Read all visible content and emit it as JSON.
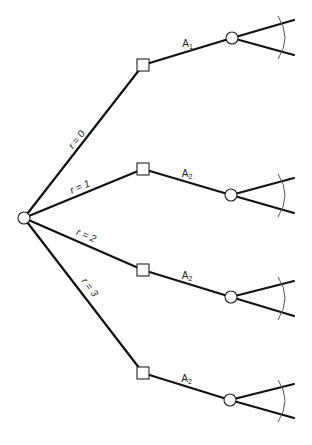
{
  "diagram": {
    "type": "decision-tree",
    "root": {
      "id": "root",
      "shape": "circle"
    },
    "branches": [
      {
        "label": "r = 0",
        "decision": {
          "shape": "square"
        },
        "action": {
          "letter": "A",
          "subscript": "1"
        },
        "chance": {
          "shape": "circle",
          "outcomes": 2
        }
      },
      {
        "label": "r = 1",
        "decision": {
          "shape": "square"
        },
        "action": {
          "letter": "A",
          "subscript": "2"
        },
        "chance": {
          "shape": "circle",
          "outcomes": 2
        }
      },
      {
        "label": "r = 2",
        "decision": {
          "shape": "square"
        },
        "action": {
          "letter": "A",
          "subscript": "2"
        },
        "chance": {
          "shape": "circle",
          "outcomes": 2
        }
      },
      {
        "label": "r = 3",
        "decision": {
          "shape": "square"
        },
        "action": {
          "letter": "A",
          "subscript": "2"
        },
        "chance": {
          "shape": "circle",
          "outcomes": 2
        }
      }
    ]
  }
}
